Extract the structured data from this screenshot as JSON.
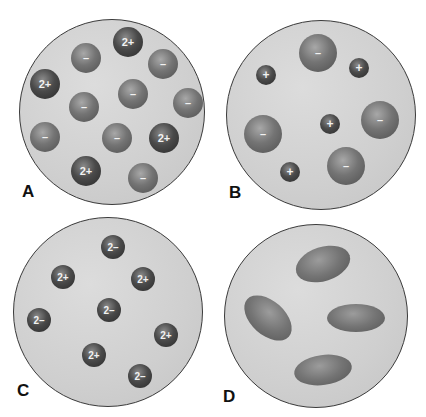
{
  "panels": [
    {
      "id": "A",
      "label": "A",
      "circle": {
        "cx": 112,
        "cy": 112,
        "r": 93
      },
      "label_pos": {
        "x": 22,
        "y": 182
      },
      "particles": [
        {
          "charge": "2+",
          "x": 128,
          "y": 42,
          "r": 15,
          "tone": "dark"
        },
        {
          "charge": "–",
          "x": 86,
          "y": 58,
          "r": 15,
          "tone": "mid"
        },
        {
          "charge": "–",
          "x": 163,
          "y": 64,
          "r": 15,
          "tone": "mid"
        },
        {
          "charge": "2+",
          "x": 45,
          "y": 84,
          "r": 15,
          "tone": "dark"
        },
        {
          "charge": "–",
          "x": 133,
          "y": 94,
          "r": 15,
          "tone": "mid"
        },
        {
          "charge": "–",
          "x": 188,
          "y": 103,
          "r": 15,
          "tone": "mid"
        },
        {
          "charge": "–",
          "x": 84,
          "y": 107,
          "r": 15,
          "tone": "mid"
        },
        {
          "charge": "–",
          "x": 45,
          "y": 137,
          "r": 15,
          "tone": "mid"
        },
        {
          "charge": "–",
          "x": 117,
          "y": 138,
          "r": 15,
          "tone": "mid"
        },
        {
          "charge": "2+",
          "x": 164,
          "y": 138,
          "r": 15,
          "tone": "dark"
        },
        {
          "charge": "2+",
          "x": 86,
          "y": 171,
          "r": 15,
          "tone": "dark"
        },
        {
          "charge": "–",
          "x": 143,
          "y": 178,
          "r": 15,
          "tone": "mid"
        }
      ]
    },
    {
      "id": "B",
      "label": "B",
      "circle": {
        "cx": 321,
        "cy": 115,
        "r": 95
      },
      "label_pos": {
        "x": 229,
        "y": 183
      },
      "particles": [
        {
          "charge": "–",
          "x": 318,
          "y": 53,
          "r": 19,
          "tone": "mid"
        },
        {
          "charge": "+",
          "x": 266,
          "y": 75,
          "r": 10,
          "tone": "dark"
        },
        {
          "charge": "+",
          "x": 359,
          "y": 68,
          "r": 10,
          "tone": "dark"
        },
        {
          "charge": "–",
          "x": 380,
          "y": 120,
          "r": 19,
          "tone": "mid"
        },
        {
          "charge": "+",
          "x": 330,
          "y": 124,
          "r": 10,
          "tone": "dark"
        },
        {
          "charge": "–",
          "x": 263,
          "y": 134,
          "r": 19,
          "tone": "mid"
        },
        {
          "charge": "–",
          "x": 346,
          "y": 166,
          "r": 19,
          "tone": "mid"
        },
        {
          "charge": "+",
          "x": 290,
          "y": 172,
          "r": 10,
          "tone": "dark"
        }
      ]
    },
    {
      "id": "C",
      "label": "C",
      "circle": {
        "cx": 108,
        "cy": 312,
        "r": 95
      },
      "label_pos": {
        "x": 17,
        "y": 381
      },
      "particles": [
        {
          "charge": "2–",
          "x": 113,
          "y": 247,
          "r": 12,
          "tone": "dark"
        },
        {
          "charge": "2+",
          "x": 63,
          "y": 277,
          "r": 12,
          "tone": "dark"
        },
        {
          "charge": "2+",
          "x": 143,
          "y": 279,
          "r": 12,
          "tone": "dark"
        },
        {
          "charge": "2–",
          "x": 109,
          "y": 310,
          "r": 12,
          "tone": "dark"
        },
        {
          "charge": "2–",
          "x": 39,
          "y": 320,
          "r": 12,
          "tone": "dark"
        },
        {
          "charge": "2+",
          "x": 166,
          "y": 335,
          "r": 12,
          "tone": "dark"
        },
        {
          "charge": "2+",
          "x": 94,
          "y": 355,
          "r": 12,
          "tone": "dark"
        },
        {
          "charge": "2–",
          "x": 140,
          "y": 376,
          "r": 12,
          "tone": "dark"
        }
      ]
    },
    {
      "id": "D",
      "label": "D",
      "circle": {
        "cx": 316,
        "cy": 316,
        "r": 92
      },
      "label_pos": {
        "x": 223,
        "y": 387
      },
      "blobs": [
        {
          "x": 323,
          "y": 264,
          "w": 56,
          "h": 34,
          "angle": -18
        },
        {
          "x": 268,
          "y": 318,
          "w": 56,
          "h": 34,
          "angle": 42
        },
        {
          "x": 356,
          "y": 318,
          "w": 58,
          "h": 28,
          "angle": 0
        },
        {
          "x": 323,
          "y": 370,
          "w": 58,
          "h": 30,
          "angle": -8
        }
      ]
    }
  ]
}
